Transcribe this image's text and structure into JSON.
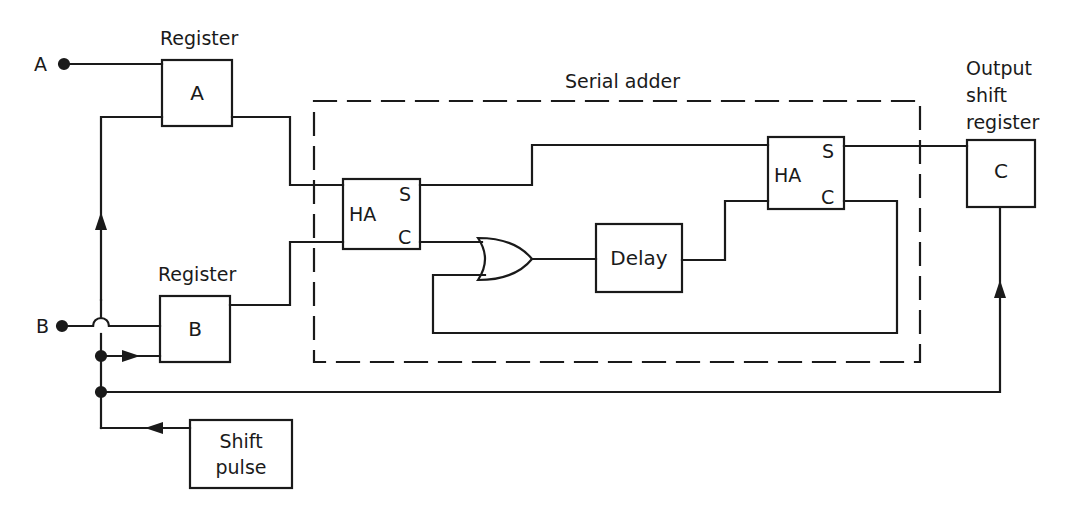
{
  "diagram": {
    "title": "Serial adder",
    "inputs": {
      "a_label": "A",
      "b_label": "B"
    },
    "register_a": {
      "caption": "Register",
      "label": "A"
    },
    "register_b": {
      "caption": "Register",
      "label": "B"
    },
    "serial_adder": {
      "caption": "Serial adder",
      "half_adder_1": {
        "label": "HA",
        "sum": "S",
        "carry": "C"
      },
      "half_adder_2": {
        "label": "HA",
        "sum": "S",
        "carry": "C"
      },
      "or_gate": "OR",
      "delay": {
        "label": "Delay"
      }
    },
    "output_register": {
      "caption_lines": [
        "Output",
        "shift",
        "register"
      ],
      "label": "C"
    },
    "shift_pulse": {
      "label_lines": [
        "Shift",
        "pulse"
      ]
    },
    "colors": {
      "line": "#1a1a1a",
      "background": "#ffffff"
    }
  }
}
